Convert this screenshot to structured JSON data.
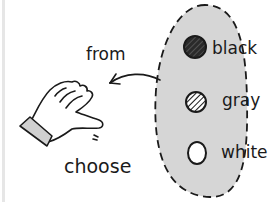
{
  "illustration": {
    "labels": {
      "from": "from",
      "choose": "choose"
    },
    "options": [
      {
        "label": "black",
        "fill": "#2a2a2a",
        "pattern": "hatched-dark"
      },
      {
        "label": "gray",
        "fill": "#ffffff",
        "pattern": "hatched"
      },
      {
        "label": "white",
        "fill": "#ffffff",
        "pattern": "none"
      }
    ],
    "colors": {
      "region_fill": "#d6d6d6",
      "outline": "#1a1a1a",
      "cuff": "#d0d0d0"
    },
    "icons": {
      "hand": "pointing-hand-icon",
      "arrow": "arrow-left-icon"
    }
  }
}
